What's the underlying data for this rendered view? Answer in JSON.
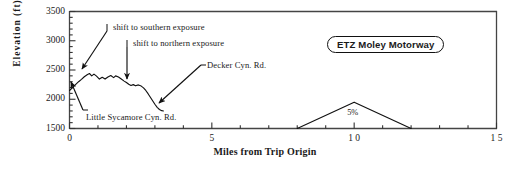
{
  "chart_data": {
    "type": "line",
    "title": "ETZ Moley Motorway",
    "xlabel": "Miles from Trip Origin",
    "ylabel": "Elevation  (ft)",
    "xlim": [
      0,
      15
    ],
    "ylim": [
      1500,
      3500
    ],
    "xticks": [
      0,
      5,
      10,
      15
    ],
    "xtick_labels": [
      "0",
      "5",
      "1 0",
      "1 5"
    ],
    "xminor_step": 1,
    "yticks": [
      1500,
      2000,
      2500,
      3000,
      3500
    ],
    "ytick_labels": [
      "1500",
      "2000",
      "2500",
      "3000",
      "3500"
    ],
    "yminor_step": 100,
    "grid": false,
    "legend": false,
    "series": [
      {
        "name": "elevation profile",
        "points": [
          [
            0.0,
            2150
          ],
          [
            0.12,
            2205
          ],
          [
            0.22,
            2255
          ],
          [
            0.32,
            2300
          ],
          [
            0.42,
            2340
          ],
          [
            0.52,
            2385
          ],
          [
            0.62,
            2420
          ],
          [
            0.7,
            2440
          ],
          [
            0.78,
            2400
          ],
          [
            0.86,
            2430
          ],
          [
            0.95,
            2395
          ],
          [
            1.05,
            2345
          ],
          [
            1.15,
            2375
          ],
          [
            1.25,
            2345
          ],
          [
            1.35,
            2380
          ],
          [
            1.45,
            2405
          ],
          [
            1.55,
            2370
          ],
          [
            1.62,
            2400
          ],
          [
            1.72,
            2380
          ],
          [
            1.82,
            2345
          ],
          [
            1.92,
            2310
          ],
          [
            2.0,
            2285
          ],
          [
            2.08,
            2255
          ],
          [
            2.16,
            2235
          ],
          [
            2.24,
            2250
          ],
          [
            2.32,
            2230
          ],
          [
            2.42,
            2245
          ],
          [
            2.52,
            2225
          ],
          [
            2.6,
            2195
          ],
          [
            2.68,
            2150
          ],
          [
            2.76,
            2095
          ],
          [
            2.84,
            2035
          ],
          [
            2.92,
            1975
          ],
          [
            3.0,
            1915
          ],
          [
            3.08,
            1862
          ],
          [
            3.16,
            1825
          ],
          [
            3.24,
            1805
          ],
          [
            3.3,
            1800
          ]
        ]
      },
      {
        "name": "grade segment",
        "points": [
          [
            8.0,
            1500
          ],
          [
            10.0,
            1950
          ],
          [
            12.0,
            1500
          ]
        ]
      }
    ],
    "annotations": [
      {
        "id": "shift-southern",
        "text": "shift to southern exposure",
        "label_x": 113,
        "label_y": 22,
        "tick_x": 107,
        "tick_y": 24,
        "tick_y2": 31,
        "arrow_from_x": 107,
        "arrow_from_y": 31,
        "arrow_to_x": 82,
        "arrow_to_y": 69
      },
      {
        "id": "shift-northern",
        "text": "shift to northern exposure",
        "label_x": 133,
        "label_y": 38,
        "tick_x": 127,
        "tick_y": 40,
        "tick_y2": 47,
        "arrow_from_x": 127,
        "arrow_from_y": 47,
        "arrow_to_x": 127,
        "arrow_to_y": 79
      },
      {
        "id": "decker-cyn-rd",
        "text": "Decker Cyn. Rd.",
        "label_x": 207,
        "label_y": 60,
        "tick_x": 201,
        "tick_y": 65,
        "tick_y2": 65,
        "arrow_from_x": 201,
        "arrow_from_y": 65,
        "arrow_to_x": 159,
        "arrow_to_y": 103
      },
      {
        "id": "little-sycamore-cyn-rd",
        "text": "Little Sycamore Cyn. Rd.",
        "label_x": 86,
        "label_y": 112,
        "tick_x": 83,
        "tick_y": 110,
        "tick_y2": 110,
        "arrow_from_x": 83,
        "arrow_from_y": 110,
        "arrow_to_x": 71,
        "arrow_to_y": 82
      }
    ],
    "data_labels": [
      {
        "id": "grade-pct",
        "text": "5%",
        "x": 10.0,
        "y": 1750
      }
    ]
  }
}
